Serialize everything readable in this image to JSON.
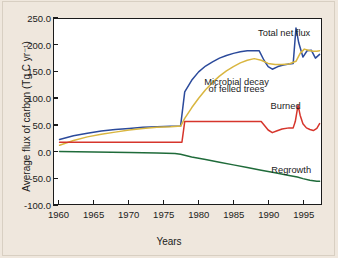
{
  "chart_data": {
    "type": "line",
    "title": "",
    "xlabel": "Years",
    "ylabel": "Average flux of carbon (Tg C yr⁻¹)",
    "xlim": [
      1959.2,
      1997.6
    ],
    "ylim": [
      -100.0,
      250.0
    ],
    "grid": false,
    "legend_position": "inline-annotations",
    "xticks": [
      1960,
      1965,
      1970,
      1975,
      1980,
      1985,
      1990,
      1995
    ],
    "xtick_labels": [
      "1960",
      "1965",
      "1970",
      "1975",
      "1980",
      "1985",
      "1990",
      "1995"
    ],
    "yticks": [
      -100.0,
      -50.0,
      0.0,
      50.0,
      100.0,
      150.0,
      200.0,
      250.0
    ],
    "ytick_labels": [
      "-100.0",
      "-50.0",
      "0.0",
      "50.0",
      "100.0",
      "150.0",
      "200.0",
      "250.0"
    ],
    "series": [
      {
        "name": "Total net flux",
        "color": "#2b4a9b",
        "label_text": "Total net flux",
        "x": [
          1960,
          1962,
          1964,
          1966,
          1968,
          1970,
          1972,
          1974,
          1976,
          1977,
          1977.4,
          1978,
          1979,
          1980,
          1981,
          1982,
          1983,
          1984,
          1985,
          1986,
          1987,
          1988,
          1988.7,
          1989.4,
          1990,
          1990.6,
          1991.4,
          1992.2,
          1993,
          1993.6,
          1994,
          1994.4,
          1995,
          1995.6,
          1996.2,
          1996.8,
          1997.4
        ],
        "y": [
          22,
          29,
          34,
          38,
          41,
          43,
          45,
          46,
          47,
          47,
          47,
          112,
          134,
          150,
          161,
          169,
          176,
          181,
          185,
          188,
          190,
          190,
          190,
          172,
          160,
          155,
          160,
          163,
          165,
          166,
          233,
          205,
          178,
          190,
          191,
          176,
          183
        ]
      },
      {
        "name": "Microbial decay of felled trees",
        "color": "#d9b640",
        "label_text": "Microbial decay\nof felled trees",
        "x": [
          1960,
          1962,
          1964,
          1966,
          1968,
          1970,
          1972,
          1974,
          1976,
          1977,
          1977.4,
          1978,
          1979,
          1980,
          1981,
          1982,
          1983,
          1984,
          1985,
          1986,
          1987,
          1988,
          1989,
          1990,
          1991,
          1992,
          1993,
          1994,
          1994.6,
          1995.2,
          1995.8,
          1996.4,
          1997,
          1997.4
        ],
        "y": [
          11,
          20,
          27,
          32,
          36,
          40,
          43,
          45,
          46,
          47,
          47,
          62,
          82,
          100,
          116,
          130,
          142,
          152,
          160,
          167,
          172,
          175,
          172,
          166,
          164,
          164,
          165,
          170,
          185,
          193,
          191,
          189,
          189,
          190
        ]
      },
      {
        "name": "Burned",
        "color": "#d6352c",
        "label_text": "Burned",
        "x": [
          1960,
          1965,
          1970,
          1975,
          1977,
          1977.3,
          1977.6,
          1978,
          1982,
          1986,
          1988.6,
          1989,
          1989.5,
          1990,
          1990.6,
          1991.2,
          1992,
          1993,
          1993.6,
          1993.9,
          1994.3,
          1994.6,
          1995,
          1995.5,
          1996,
          1996.5,
          1997,
          1997.4
        ],
        "y": [
          17,
          17,
          17,
          17,
          17,
          17,
          17,
          56,
          56,
          56,
          56,
          56,
          48,
          40,
          35,
          38,
          42,
          44,
          44,
          56,
          87,
          68,
          52,
          44,
          41,
          39,
          43,
          52
        ]
      },
      {
        "name": "Regrowth",
        "color": "#1f6b3a",
        "label_text": "Regrowth",
        "x": [
          1960,
          1965,
          1970,
          1974,
          1976.6,
          1977.4,
          1979,
          1981,
          1983,
          1985,
          1987,
          1989,
          1991,
          1993,
          1994.2,
          1995,
          1996,
          1997,
          1997.4
        ],
        "y": [
          -0.5,
          -1.5,
          -2.5,
          -3.5,
          -4.5,
          -6,
          -11,
          -16,
          -21,
          -26,
          -31,
          -36,
          -41,
          -46,
          -49,
          -52,
          -55,
          -57,
          -57
        ]
      }
    ],
    "annotations": [
      {
        "text": "Total net flux",
        "x": 1992.2,
        "y": 222
      },
      {
        "text": "Microbial decay",
        "x": 1985.4,
        "y": 131
      },
      {
        "text": "of felled trees",
        "x": 1985.4,
        "y": 117
      },
      {
        "text": "Burned",
        "x": 1992.4,
        "y": 86
      },
      {
        "text": "Regrowth",
        "x": 1993.2,
        "y": -34
      }
    ]
  },
  "figure": {
    "background_color": "#efe7dd",
    "plot_background_color": "#ffffff",
    "axis_color": "#1b1b1b"
  }
}
